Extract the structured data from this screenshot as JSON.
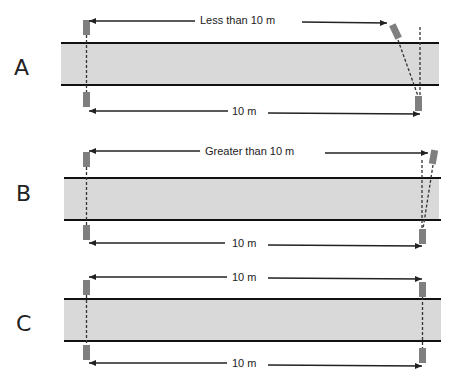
{
  "colors": {
    "road_fill": "#d9d9d9",
    "road_edge": "#111111",
    "marker": "#7f7f7f",
    "line": "#222222"
  },
  "panels": [
    {
      "id": "A",
      "letter": "A",
      "top_label": "Less than 10 m",
      "bottom_label": "10 m"
    },
    {
      "id": "B",
      "letter": "B",
      "top_label": "Greater than 10 m",
      "bottom_label": "10 m"
    },
    {
      "id": "C",
      "letter": "C",
      "top_label": "10 m",
      "bottom_label": "10 m"
    }
  ]
}
